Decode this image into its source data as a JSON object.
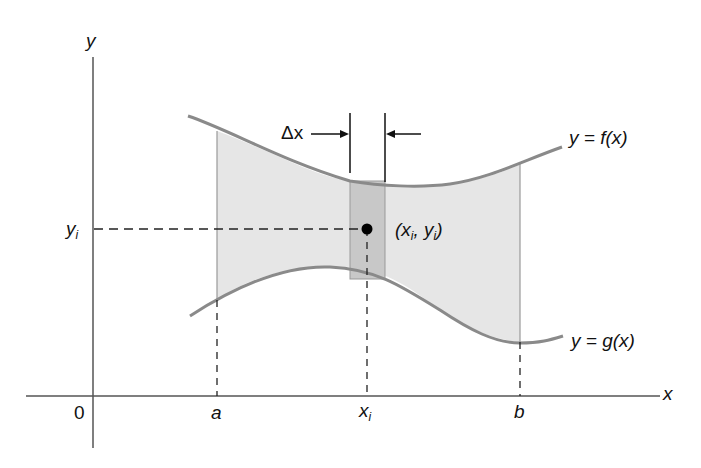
{
  "diagram": {
    "axes": {
      "x_label": "x",
      "y_label": "y",
      "origin_label": "0"
    },
    "x_ticks": {
      "a": "a",
      "xi": "x",
      "xi_sub": "i",
      "b": "b"
    },
    "y_ticks": {
      "yi": "y",
      "yi_sub": "i"
    },
    "curves": {
      "upper": "y = f(x)",
      "lower": "y = g(x)"
    },
    "strip": {
      "width_label": "Δx",
      "point_label_open": "(x",
      "point_label_sub1": "i",
      "point_label_mid": ", y",
      "point_label_sub2": "i",
      "point_label_close": ")"
    },
    "colors": {
      "region_fill": "#e6e6e6",
      "strip_fill": "#c8c8c8",
      "curve_stroke": "#8a8a8a",
      "axis_stroke": "#555555",
      "point": "#000000"
    }
  }
}
